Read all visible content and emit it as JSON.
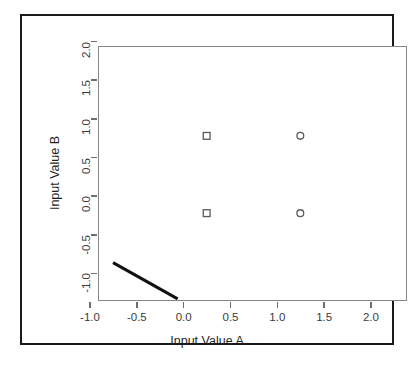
{
  "figure": {
    "background_color": "#ffffff",
    "frame_color": "#1a1a1a",
    "plot_border_color": "#868686",
    "caption_artifact": ""
  },
  "chart_data": {
    "type": "scatter",
    "title": "",
    "xlabel": "Input Value A",
    "ylabel": "Input Value B",
    "xlim": [
      -1.15,
      2.15
    ],
    "ylim": [
      -1.15,
      2.15
    ],
    "grid": false,
    "legend": "none",
    "xticks": [
      -1.0,
      -0.5,
      0.0,
      0.5,
      1.0,
      1.5,
      2.0
    ],
    "xtick_labels": [
      "-1.0",
      "-0.5",
      "0.0",
      "0.5",
      "1.0",
      "1.5",
      "2.0"
    ],
    "yticks": [
      -1.0,
      -0.5,
      0.0,
      0.5,
      1.0,
      1.5,
      2.0
    ],
    "ytick_labels": [
      "-1.0",
      "-0.5",
      "0.0",
      "0.5",
      "1.0",
      "1.5",
      "2.0"
    ],
    "series": [
      {
        "name": "class-square",
        "marker": "open-square",
        "color": "#5a5a5a",
        "points": [
          {
            "x": 0.0,
            "y": 0.0
          },
          {
            "x": 0.0,
            "y": 1.0
          }
        ]
      },
      {
        "name": "class-circle",
        "marker": "open-circle",
        "color": "#5a5a5a",
        "points": [
          {
            "x": 1.0,
            "y": 0.0
          },
          {
            "x": 1.0,
            "y": 1.0
          }
        ]
      }
    ],
    "annotations": [
      {
        "name": "decision-boundary",
        "type": "line-segment",
        "color": "#111111",
        "width": 3,
        "x0": -1.0,
        "y0": -0.64,
        "x1": -0.31,
        "y1": -1.11
      }
    ]
  }
}
